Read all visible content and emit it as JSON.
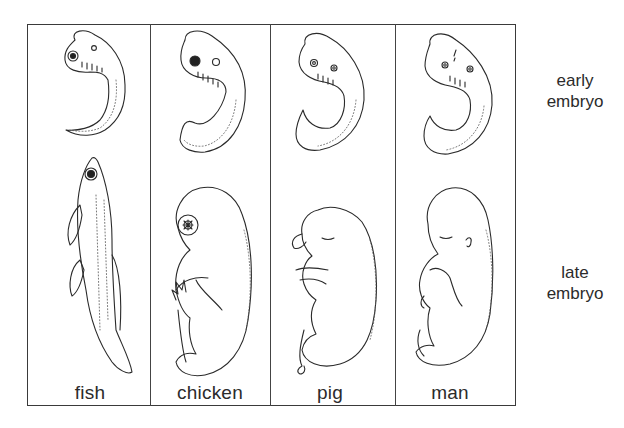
{
  "figure": {
    "type": "comparative embryology diagram",
    "columns": [
      {
        "label": "fish"
      },
      {
        "label": "chicken"
      },
      {
        "label": "pig"
      },
      {
        "label": "man"
      }
    ],
    "rows": [
      {
        "label_line1": "early",
        "label_line2": "embryo"
      },
      {
        "label_line1": "late",
        "label_line2": "embryo"
      }
    ],
    "colors": {
      "line": "#2a2a2a",
      "background": "#ffffff"
    }
  }
}
